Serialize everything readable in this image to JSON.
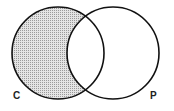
{
  "diagram": {
    "type": "venn",
    "sets": [
      {
        "label": "C",
        "cx": 58,
        "cy": 53,
        "r": 46
      },
      {
        "label": "P",
        "cx": 113,
        "cy": 53,
        "r": 46
      }
    ],
    "shaded_region": "C minus P",
    "colors": {
      "stroke": "#111111",
      "shade": "#c8c8c8",
      "background": "#ffffff"
    }
  }
}
